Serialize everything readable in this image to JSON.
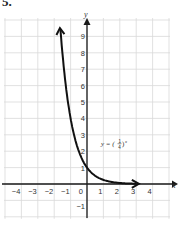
{
  "problem_number": "5.",
  "chart_data": {
    "type": "line",
    "title": "",
    "function_label": "y = (1/4)^x",
    "function_label_base_num": "1",
    "function_label_base_den": "4",
    "xlabel": "x",
    "ylabel": "y",
    "xlim": [
      -5,
      5
    ],
    "ylim": [
      -2,
      10
    ],
    "grid": true,
    "x_ticks": [
      "-4",
      "-3",
      "-2",
      "-1",
      "0",
      "1",
      "2",
      "3",
      "4"
    ],
    "y_ticks": [
      "-1",
      "1",
      "2",
      "3",
      "4",
      "5",
      "6",
      "7",
      "8",
      "9"
    ],
    "series": [
      {
        "name": "y = (1/4)^x",
        "x": [
          -1.6,
          -1.5,
          -1.25,
          -1,
          -0.75,
          -0.5,
          -0.25,
          0,
          0.5,
          1,
          1.5,
          2,
          2.5,
          3,
          3.2
        ],
        "y": [
          9.19,
          8,
          5.66,
          4,
          2.83,
          2,
          1.41,
          1,
          0.5,
          0.25,
          0.125,
          0.0625,
          0.03,
          0.016,
          0.012
        ]
      }
    ],
    "colors": {
      "grid": "#d9d9d9",
      "axis": "#1a1a1a",
      "curve": "#111111",
      "text": "#333333"
    }
  }
}
